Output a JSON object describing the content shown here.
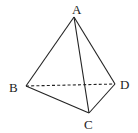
{
  "diagram": {
    "type": "tetrahedron",
    "vertices": {
      "A": {
        "label": "A",
        "x": 74,
        "y": 17,
        "label_x": 72,
        "label_y": 14
      },
      "B": {
        "label": "B",
        "x": 26,
        "y": 86,
        "label_x": 9,
        "label_y": 92
      },
      "C": {
        "label": "C",
        "x": 89,
        "y": 113,
        "label_x": 84,
        "label_y": 129
      },
      "D": {
        "label": "D",
        "x": 115,
        "y": 84,
        "label_x": 120,
        "label_y": 89
      }
    },
    "edges": [
      {
        "from": "A",
        "to": "B",
        "style": "solid"
      },
      {
        "from": "A",
        "to": "C",
        "style": "solid"
      },
      {
        "from": "A",
        "to": "D",
        "style": "solid"
      },
      {
        "from": "B",
        "to": "C",
        "style": "solid"
      },
      {
        "from": "C",
        "to": "D",
        "style": "solid"
      },
      {
        "from": "B",
        "to": "D",
        "style": "dashed"
      }
    ],
    "line_color": "#222222"
  }
}
